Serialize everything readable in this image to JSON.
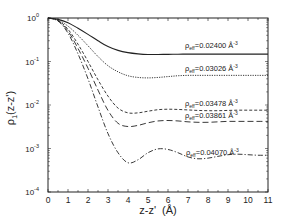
{
  "chart_data": {
    "type": "line",
    "title": "",
    "xlabel": "z-z'  (Å)",
    "ylabel": "ρ1(z-z')",
    "xlim": [
      0,
      11
    ],
    "ylim": [
      0.0001,
      1
    ],
    "yscale": "log",
    "grid": false,
    "legend_position": "inline labels above each curve",
    "x_ticks": [
      "0",
      "1",
      "2",
      "3",
      "4",
      "5",
      "6",
      "7",
      "8",
      "9",
      "10",
      "11"
    ],
    "y_ticks": [
      {
        "value": 1,
        "label_base": "10",
        "label_exp": "0"
      },
      {
        "value": 0.1,
        "label_base": "10",
        "label_exp": "-1"
      },
      {
        "value": 0.01,
        "label_base": "10",
        "label_exp": "-2"
      },
      {
        "value": 0.001,
        "label_base": "10",
        "label_exp": "-3"
      },
      {
        "value": 0.0001,
        "label_base": "10",
        "label_exp": "-4"
      }
    ],
    "x": [
      0,
      0.5,
      1,
      1.5,
      2,
      2.5,
      3,
      3.5,
      4,
      4.5,
      5,
      5.5,
      6,
      6.5,
      7,
      7.5,
      8,
      8.5,
      9,
      9.5,
      10,
      10.5,
      11
    ],
    "series": [
      {
        "name": "ρeff=0.02400 Å⁻³",
        "label": "ρ_eff=0.02400 Å^-3",
        "style": "solid",
        "values": [
          1,
          0.93,
          0.78,
          0.58,
          0.42,
          0.3,
          0.22,
          0.18,
          0.16,
          0.15,
          0.145,
          0.145,
          0.146,
          0.147,
          0.148,
          0.148,
          0.148,
          0.148,
          0.148,
          0.148,
          0.148,
          0.148,
          0.148
        ]
      },
      {
        "name": "ρeff=0.03026 Å⁻³",
        "label": "ρ_eff=0.03026 Å^-3",
        "style": "dotted",
        "values": [
          1,
          0.9,
          0.65,
          0.4,
          0.23,
          0.13,
          0.08,
          0.058,
          0.047,
          0.043,
          0.042,
          0.043,
          0.045,
          0.047,
          0.048,
          0.048,
          0.048,
          0.048,
          0.048,
          0.048,
          0.048,
          0.048,
          0.048
        ]
      },
      {
        "name": "ρeff=0.03478 Å⁻³",
        "label": "ρ_eff=0.03478 Å^-3",
        "style": "short-dash",
        "values": [
          1,
          0.88,
          0.55,
          0.25,
          0.1,
          0.038,
          0.016,
          0.0085,
          0.0066,
          0.0066,
          0.0072,
          0.0078,
          0.008,
          0.0079,
          0.0077,
          0.0075,
          0.0074,
          0.0074,
          0.0075,
          0.0076,
          0.0076,
          0.0076,
          0.0076
        ]
      },
      {
        "name": "ρeff=0.03861 Å⁻³",
        "label": "ρ_eff=0.03861 Å^-3",
        "style": "long-dash",
        "values": [
          1,
          0.87,
          0.5,
          0.2,
          0.07,
          0.022,
          0.0075,
          0.0038,
          0.0032,
          0.0034,
          0.0039,
          0.0043,
          0.0044,
          0.0043,
          0.0041,
          0.004,
          0.004,
          0.0041,
          0.0042,
          0.0042,
          0.0042,
          0.0042,
          0.0042
        ]
      },
      {
        "name": "ρeff=0.04070 Å⁻³",
        "label": "ρ_eff=0.04070 Å^-3",
        "style": "dash-dot",
        "values": [
          1,
          0.85,
          0.45,
          0.15,
          0.04,
          0.009,
          0.0022,
          0.0008,
          0.00047,
          0.00055,
          0.0008,
          0.00098,
          0.00095,
          0.0008,
          0.00064,
          0.00058,
          0.0006,
          0.00066,
          0.00072,
          0.00074,
          0.00072,
          0.0007,
          0.0007
        ]
      }
    ],
    "annotations": [
      {
        "text_rho": "ρ",
        "text_sub": "eff",
        "text_val": "=0.02400 Å",
        "text_sup": "-3",
        "x_px": 185,
        "y_px": 48
      },
      {
        "text_rho": "ρ",
        "text_sub": "eff",
        "text_val": "=0.03026 Å",
        "text_sup": "-3",
        "x_px": 185,
        "y_px": 71
      },
      {
        "text_rho": "ρ",
        "text_sub": "eff",
        "text_val": "=0.03478 Å",
        "text_sup": "-3",
        "x_px": 185,
        "y_px": 106
      },
      {
        "text_rho": "ρ",
        "text_sub": "eff",
        "text_val": "=0.03861 Å",
        "text_sup": "-3",
        "x_px": 185,
        "y_px": 118
      },
      {
        "text_rho": "ρ",
        "text_sub": "eff",
        "text_val": "=0.04070 Å",
        "text_sup": "-3",
        "x_px": 186,
        "y_px": 155
      }
    ]
  },
  "axes": {
    "ylabel_main": "ρ",
    "ylabel_sub": "1",
    "ylabel_arg": "(z-z')",
    "xlabel": "z-z'  (Å)"
  }
}
